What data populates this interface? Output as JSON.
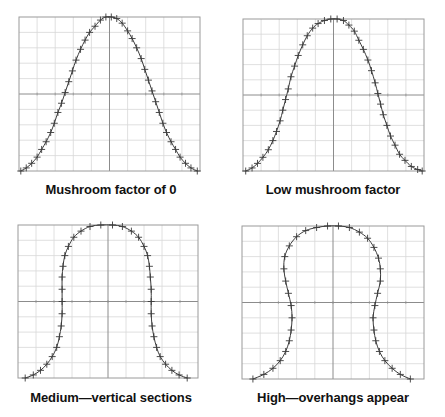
{
  "figure": {
    "panels": [
      {
        "caption": "Mushroom factor of 0",
        "box": [
          19,
          17,
          200,
          171
        ]
      },
      {
        "caption": "Low mushroom factor",
        "box": [
          243,
          19,
          424,
          171
        ]
      },
      {
        "caption": "Medium—vertical sections",
        "box": [
          18,
          225,
          198,
          378
        ]
      },
      {
        "caption": "High—overhangs appear",
        "box": [
          242,
          226,
          424,
          379
        ]
      }
    ],
    "colors": {
      "grid": "#d8d8d8",
      "frame": "#9a9a9a",
      "axis": "#8c8c8c",
      "curve": "#3a3a3a",
      "marker": "#3a3a3a"
    }
  },
  "chart_data": [
    {
      "type": "line",
      "title": "Mushroom factor of 0",
      "xlabel": "",
      "ylabel": "",
      "xlim": [
        -1,
        1
      ],
      "ylim": [
        0,
        1
      ],
      "grid": true,
      "markers": "plus",
      "points": [
        [
          -0.98,
          0.0
        ],
        [
          -0.92,
          0.02
        ],
        [
          -0.86,
          0.05
        ],
        [
          -0.8,
          0.09
        ],
        [
          -0.75,
          0.14
        ],
        [
          -0.7,
          0.19
        ],
        [
          -0.65,
          0.25
        ],
        [
          -0.61,
          0.31
        ],
        [
          -0.57,
          0.38
        ],
        [
          -0.53,
          0.44
        ],
        [
          -0.49,
          0.51
        ],
        [
          -0.45,
          0.58
        ],
        [
          -0.41,
          0.65
        ],
        [
          -0.37,
          0.72
        ],
        [
          -0.32,
          0.79
        ],
        [
          -0.27,
          0.85
        ],
        [
          -0.22,
          0.9
        ],
        [
          -0.16,
          0.94
        ],
        [
          -0.1,
          0.98
        ],
        [
          -0.04,
          1.0
        ],
        [
          0.02,
          1.0
        ],
        [
          0.08,
          0.99
        ],
        [
          0.14,
          0.96
        ],
        [
          0.2,
          0.91
        ],
        [
          0.25,
          0.86
        ],
        [
          0.3,
          0.8
        ],
        [
          0.35,
          0.73
        ],
        [
          0.39,
          0.66
        ],
        [
          0.43,
          0.59
        ],
        [
          0.47,
          0.52
        ],
        [
          0.51,
          0.45
        ],
        [
          0.55,
          0.38
        ],
        [
          0.59,
          0.31
        ],
        [
          0.63,
          0.25
        ],
        [
          0.68,
          0.19
        ],
        [
          0.73,
          0.14
        ],
        [
          0.78,
          0.09
        ],
        [
          0.84,
          0.05
        ],
        [
          0.9,
          0.02
        ],
        [
          0.97,
          0.0
        ]
      ]
    },
    {
      "type": "line",
      "title": "Low mushroom factor",
      "xlabel": "",
      "ylabel": "",
      "xlim": [
        -1,
        1
      ],
      "ylim": [
        0,
        1
      ],
      "grid": true,
      "markers": "plus",
      "points": [
        [
          -0.97,
          0.0
        ],
        [
          -0.9,
          0.02
        ],
        [
          -0.84,
          0.05
        ],
        [
          -0.78,
          0.09
        ],
        [
          -0.72,
          0.14
        ],
        [
          -0.67,
          0.2
        ],
        [
          -0.63,
          0.26
        ],
        [
          -0.59,
          0.33
        ],
        [
          -0.56,
          0.4
        ],
        [
          -0.53,
          0.47
        ],
        [
          -0.5,
          0.54
        ],
        [
          -0.47,
          0.62
        ],
        [
          -0.43,
          0.69
        ],
        [
          -0.39,
          0.76
        ],
        [
          -0.34,
          0.83
        ],
        [
          -0.29,
          0.89
        ],
        [
          -0.23,
          0.94
        ],
        [
          -0.17,
          0.97
        ],
        [
          -0.1,
          0.99
        ],
        [
          -0.03,
          1.0
        ],
        [
          0.04,
          1.0
        ],
        [
          0.11,
          0.99
        ],
        [
          0.17,
          0.96
        ],
        [
          0.23,
          0.92
        ],
        [
          0.28,
          0.86
        ],
        [
          0.33,
          0.8
        ],
        [
          0.38,
          0.73
        ],
        [
          0.42,
          0.66
        ],
        [
          0.46,
          0.58
        ],
        [
          0.49,
          0.51
        ],
        [
          0.52,
          0.44
        ],
        [
          0.55,
          0.37
        ],
        [
          0.59,
          0.3
        ],
        [
          0.63,
          0.23
        ],
        [
          0.68,
          0.17
        ],
        [
          0.73,
          0.11
        ],
        [
          0.79,
          0.07
        ],
        [
          0.86,
          0.03
        ],
        [
          0.93,
          0.01
        ],
        [
          0.98,
          0.0
        ]
      ]
    },
    {
      "type": "line",
      "title": "Medium—vertical sections",
      "xlabel": "",
      "ylabel": "",
      "xlim": [
        -1,
        1
      ],
      "ylim": [
        0,
        1
      ],
      "grid": true,
      "markers": "plus",
      "points": [
        [
          -0.92,
          0.0
        ],
        [
          -0.83,
          0.02
        ],
        [
          -0.75,
          0.05
        ],
        [
          -0.68,
          0.09
        ],
        [
          -0.62,
          0.14
        ],
        [
          -0.57,
          0.2
        ],
        [
          -0.54,
          0.27
        ],
        [
          -0.52,
          0.34
        ],
        [
          -0.51,
          0.42
        ],
        [
          -0.51,
          0.5
        ],
        [
          -0.51,
          0.58
        ],
        [
          -0.51,
          0.66
        ],
        [
          -0.5,
          0.73
        ],
        [
          -0.48,
          0.8
        ],
        [
          -0.44,
          0.86
        ],
        [
          -0.38,
          0.92
        ],
        [
          -0.3,
          0.96
        ],
        [
          -0.2,
          0.99
        ],
        [
          -0.08,
          1.0
        ],
        [
          0.05,
          1.0
        ],
        [
          0.16,
          0.99
        ],
        [
          0.26,
          0.96
        ],
        [
          0.34,
          0.92
        ],
        [
          0.4,
          0.86
        ],
        [
          0.44,
          0.8
        ],
        [
          0.46,
          0.73
        ],
        [
          0.47,
          0.66
        ],
        [
          0.48,
          0.58
        ],
        [
          0.48,
          0.5
        ],
        [
          0.48,
          0.42
        ],
        [
          0.49,
          0.34
        ],
        [
          0.51,
          0.27
        ],
        [
          0.54,
          0.2
        ],
        [
          0.58,
          0.14
        ],
        [
          0.64,
          0.09
        ],
        [
          0.71,
          0.05
        ],
        [
          0.79,
          0.02
        ],
        [
          0.88,
          0.0
        ]
      ]
    },
    {
      "type": "line",
      "title": "High—overhangs appear",
      "xlabel": "",
      "ylabel": "",
      "xlim": [
        -1,
        1
      ],
      "ylim": [
        0,
        1
      ],
      "grid": true,
      "markers": "plus",
      "points": [
        [
          -0.88,
          0.0
        ],
        [
          -0.76,
          0.03
        ],
        [
          -0.66,
          0.07
        ],
        [
          -0.58,
          0.12
        ],
        [
          -0.52,
          0.18
        ],
        [
          -0.48,
          0.25
        ],
        [
          -0.46,
          0.32
        ],
        [
          -0.45,
          0.4
        ],
        [
          -0.46,
          0.48
        ],
        [
          -0.49,
          0.56
        ],
        [
          -0.52,
          0.64
        ],
        [
          -0.54,
          0.72
        ],
        [
          -0.53,
          0.8
        ],
        [
          -0.48,
          0.87
        ],
        [
          -0.4,
          0.93
        ],
        [
          -0.3,
          0.97
        ],
        [
          -0.18,
          0.99
        ],
        [
          -0.06,
          1.0
        ],
        [
          0.06,
          1.0
        ],
        [
          0.18,
          0.99
        ],
        [
          0.29,
          0.96
        ],
        [
          0.38,
          0.92
        ],
        [
          0.45,
          0.86
        ],
        [
          0.5,
          0.79
        ],
        [
          0.52,
          0.72
        ],
        [
          0.52,
          0.64
        ],
        [
          0.49,
          0.56
        ],
        [
          0.46,
          0.48
        ],
        [
          0.44,
          0.4
        ],
        [
          0.45,
          0.32
        ],
        [
          0.47,
          0.25
        ],
        [
          0.51,
          0.18
        ],
        [
          0.57,
          0.12
        ],
        [
          0.65,
          0.07
        ],
        [
          0.74,
          0.03
        ],
        [
          0.85,
          0.0
        ]
      ]
    }
  ]
}
